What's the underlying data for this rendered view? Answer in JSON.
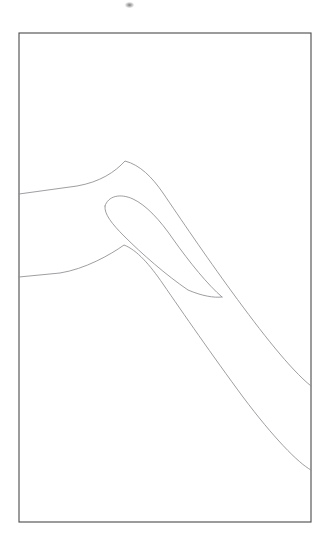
{
  "figure": {
    "title": "",
    "background_color": "#ffffff",
    "frame": {
      "name": "border-rectangle",
      "x": 19,
      "y": 33,
      "width": 292,
      "height": 489,
      "stroke_color": "#4a4a4a",
      "stroke_width": 1.1
    },
    "artifact": {
      "name": "scan-smudge",
      "x": 125,
      "y": 2,
      "width": 9,
      "height": 6,
      "color": "#5a5a5f"
    },
    "line_color": "#8d8d92",
    "line_width": 0.85,
    "strokes": [
      {
        "name": "outer-upper-contour",
        "description": "upper outer boundary entering left border, rising to rounded apex then sweeping down to lower right border",
        "path": "M 19 194 L 77 186 C 100 182 115 172 125 161 C 140 165 152 177 163 193 C 180 218 205 255 232 292 C 262 333 290 369 311 386"
      },
      {
        "name": "inner-hook-outer-edge",
        "description": "inner barb outer edge, rounded tip at left sweeping down right to a fine point",
        "path": "M 105 206 C 108 196 120 193 133 199 C 146 205 160 220 173 239 C 190 263 208 285 222 297"
      },
      {
        "name": "inner-hook-inner-edge",
        "description": "inner barb inner edge returning from rounded tip down to the same fine point",
        "path": "M 105 206 C 104 214 112 224 124 236 C 142 254 166 275 188 290 C 202 296 214 298 222 297"
      },
      {
        "name": "outer-lower-contour",
        "description": "lower outer boundary entering left border, rising to a softer apex then sweeping down to lower right border",
        "path": "M 19 277 L 60 273 C 85 269 110 255 124 245 C 137 250 150 265 163 284 C 183 313 212 355 243 397 C 273 437 298 463 311 470"
      }
    ]
  }
}
